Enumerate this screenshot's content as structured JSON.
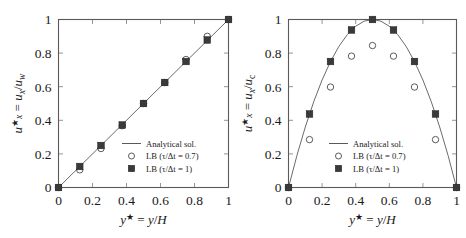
{
  "figure": {
    "background": "#ffffff",
    "line_color": "#6b6b6b",
    "square_color": "#3a3a3a",
    "circle_color": "#ffffff"
  },
  "legend": {
    "analytical": "Analytical sol.",
    "lb_07": "LB (τ/Δt = 0.7)",
    "lb_1": "LB (τ/Δt = 1)"
  },
  "axis_labels": {
    "x": "y★ = y/H",
    "x_sym": "y",
    "x_star": "★",
    "x_eq": " = y/H",
    "y_left": "u★x = ux/uw",
    "y_right": "u★x = ux/uc"
  },
  "ticks": {
    "x": [
      "0",
      "0.2",
      "0.4",
      "0.6",
      "0.8",
      "1"
    ],
    "y": [
      "0",
      "0.2",
      "0.4",
      "0.6",
      "0.8",
      "1"
    ],
    "x_values": [
      0,
      0.2,
      0.4,
      0.6,
      0.8,
      1
    ],
    "y_values": [
      0,
      0.2,
      0.4,
      0.6,
      0.8,
      1
    ]
  },
  "chart_data": [
    {
      "type": "scatter",
      "title": "Couette flow velocity profile",
      "panel": "left",
      "xlabel": "y* = y/H",
      "ylabel": "u*_x = u_x/u_w",
      "xlim": [
        0,
        1
      ],
      "ylim": [
        0,
        1
      ],
      "grid": false,
      "legend_position": "lower-right-inside",
      "series": [
        {
          "name": "Analytical sol.",
          "marker": "line",
          "x": [
            0,
            1
          ],
          "values": [
            0,
            1
          ]
        },
        {
          "name": "LB (τ/Δt = 0.7)",
          "marker": "open-circle",
          "x": [
            0,
            0.125,
            0.25,
            0.375,
            0.5,
            0.625,
            0.75,
            0.875,
            1
          ],
          "values": [
            0,
            0.105,
            0.232,
            0.368,
            0.5,
            0.625,
            0.762,
            0.9,
            1
          ]
        },
        {
          "name": "LB (τ/Δt = 1)",
          "marker": "filled-square",
          "x": [
            0,
            0.125,
            0.25,
            0.375,
            0.5,
            0.625,
            0.75,
            0.875,
            1
          ],
          "values": [
            0,
            0.125,
            0.25,
            0.372,
            0.5,
            0.625,
            0.75,
            0.878,
            1
          ]
        }
      ]
    },
    {
      "type": "scatter",
      "title": "Poiseuille flow velocity profile",
      "panel": "right",
      "xlabel": "y* = y/H",
      "ylabel": "u*_x = u_x/u_c",
      "xlim": [
        0,
        1
      ],
      "ylim": [
        0,
        1
      ],
      "grid": false,
      "legend_position": "lower-center-inside",
      "series": [
        {
          "name": "Analytical sol.",
          "marker": "line",
          "equation": "4y*(1-y*)",
          "x": [
            0,
            0.05,
            0.1,
            0.15,
            0.2,
            0.25,
            0.3,
            0.35,
            0.4,
            0.45,
            0.5,
            0.55,
            0.6,
            0.65,
            0.7,
            0.75,
            0.8,
            0.85,
            0.9,
            0.95,
            1
          ],
          "values": [
            0,
            0.19,
            0.36,
            0.51,
            0.64,
            0.75,
            0.84,
            0.91,
            0.96,
            0.99,
            1,
            0.99,
            0.96,
            0.91,
            0.84,
            0.75,
            0.64,
            0.51,
            0.36,
            0.19,
            0
          ]
        },
        {
          "name": "LB (τ/Δt = 0.7)",
          "marker": "open-circle",
          "x": [
            0,
            0.125,
            0.25,
            0.375,
            0.5,
            0.625,
            0.75,
            0.875,
            1
          ],
          "values": [
            0,
            0.285,
            0.598,
            0.782,
            0.845,
            0.782,
            0.598,
            0.285,
            0
          ]
        },
        {
          "name": "LB (τ/Δt = 1)",
          "marker": "filled-square",
          "x": [
            0,
            0.125,
            0.25,
            0.375,
            0.5,
            0.625,
            0.75,
            0.875,
            1
          ],
          "values": [
            0,
            0.4375,
            0.75,
            0.9375,
            1.0,
            0.9375,
            0.75,
            0.4375,
            0
          ]
        }
      ]
    }
  ]
}
